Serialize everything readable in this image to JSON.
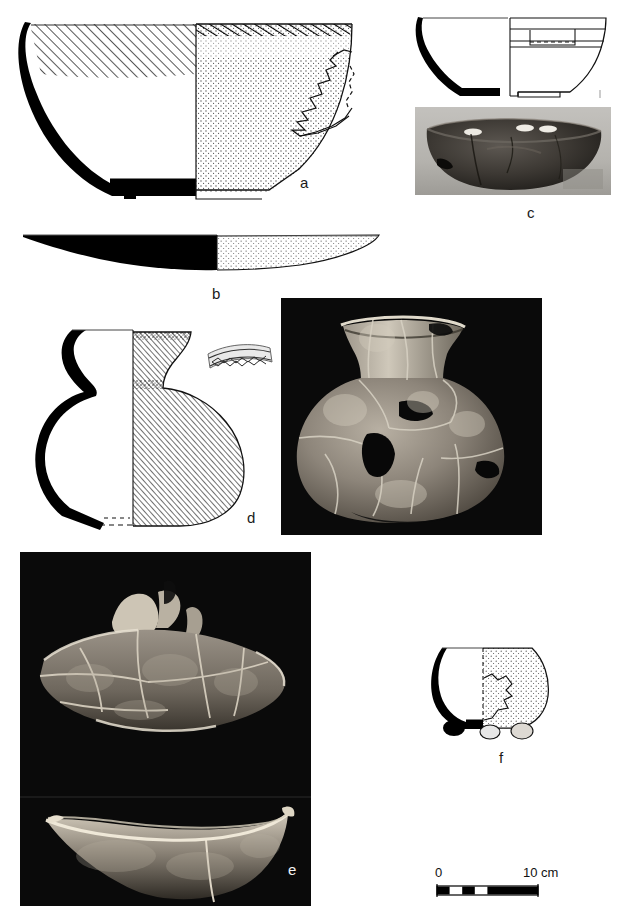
{
  "figure": {
    "kind": "archaeological-pottery-plate",
    "background_color": "#ffffff",
    "ink_color": "#000000",
    "panel_count": 6
  },
  "panels": [
    {
      "id": "a",
      "label": "a",
      "kind": "profile-drawing",
      "description": "Open carinated bowl, half section left (black rim/wall core) with hatched interior band, half exterior right with stippled surface and irregular break outline",
      "label_x": 300,
      "label_y": 175
    },
    {
      "id": "b",
      "label": "b",
      "kind": "profile-drawing",
      "description": "Shallow flat dish / lid profile, left half solid black section, right half stippled exterior tapering to a point",
      "label_x": 212,
      "label_y": 286
    },
    {
      "id": "c",
      "label": "c",
      "kind": "profile-drawing-and-photo",
      "description": "Carinated bowl profile with grooved band, paired with greyscale photograph of the reconstructed dark bowl",
      "label_x": 527,
      "label_y": 213
    },
    {
      "id": "d",
      "label": "d",
      "kind": "profile-drawing-and-photo",
      "description": "Necked globular jar, half section with dense diagonal hatching, decorated rim-band sherd detail at right; paired with photograph of reconstructed jar on black ground",
      "label_x": 247,
      "label_y": 517
    },
    {
      "id": "e",
      "label": "e",
      "kind": "photo",
      "description": "Two stacked photographs on black ground: refitted sherd group seen from above, and curved bowl profile below",
      "label_x": 288,
      "label_y": 872
    },
    {
      "id": "f",
      "label": "f",
      "kind": "profile-drawing",
      "description": "Small round-bodied footed cup, black section left, stippled exterior right with break outline and two small feet",
      "label_x": 499,
      "label_y": 759
    }
  ],
  "photographs": [
    {
      "panel": "c",
      "x": 415,
      "y": 107,
      "width": 196,
      "height": 88,
      "ground": "#b9b7b2",
      "subject": "dark carinated bowl, side view"
    },
    {
      "panel": "d",
      "x": 281,
      "y": 298,
      "width": 261,
      "height": 237,
      "ground": "#0b0b0b",
      "subject": "reconstructed globular jar with flaring neck"
    },
    {
      "panel": "e",
      "x": 20,
      "y": 552,
      "width": 291,
      "height": 354,
      "ground": "#0a0a0a",
      "subject": "refitted sherds, two views"
    }
  ],
  "scalebar": {
    "start_label": "0",
    "end_label": "10 cm",
    "unit": "cm",
    "length_value": 10,
    "x": 437,
    "y": 886,
    "pixel_length": 101,
    "segments": 4,
    "fill_dark": "#000000",
    "fill_light": "#ffffff"
  }
}
